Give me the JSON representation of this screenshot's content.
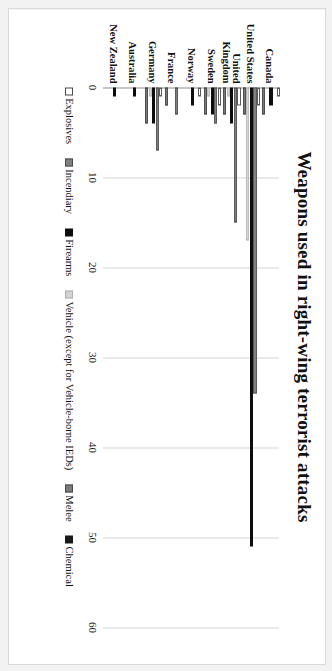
{
  "chart_data": {
    "type": "bar",
    "orientation": "horizontal",
    "title": "Weapons used in right-wing terrorist attacks",
    "xlabel": "",
    "ylabel": "",
    "xlim": [
      0,
      60
    ],
    "ticks": [
      0,
      10,
      20,
      30,
      40,
      50,
      60
    ],
    "grid": true,
    "legend_position": "bottom",
    "categories": [
      "Canada",
      "United States",
      "United Kingdom",
      "Sweden",
      "Norway",
      "France",
      "Germany",
      "Australia",
      "New Zealand"
    ],
    "series": [
      {
        "name": "Explosives",
        "color": "#ffffff",
        "values": [
          1,
          2,
          2,
          2,
          1,
          0,
          1,
          0,
          0
        ]
      },
      {
        "name": "Incendiary",
        "color": "#808080",
        "values": [
          0,
          34,
          15,
          4,
          0,
          3,
          7,
          0,
          0
        ]
      },
      {
        "name": "Firearms",
        "color": "#0d0d0d",
        "values": [
          2,
          51,
          4,
          3,
          2,
          0,
          4,
          1,
          1
        ]
      },
      {
        "name": "Vehicle (except for Vehicle-borne IEDs)",
        "color": "#d4d4d4",
        "values": [
          0,
          17,
          1,
          1,
          0,
          0,
          1,
          0,
          0
        ]
      },
      {
        "name": "Melee",
        "color": "#7a7a7a",
        "values": [
          3,
          3,
          3,
          3,
          0,
          2,
          4,
          0,
          0
        ]
      },
      {
        "name": "Chemical",
        "color": "#1a1a1a",
        "values": [
          0,
          0,
          0,
          0,
          0,
          0,
          0,
          0,
          0
        ]
      }
    ]
  },
  "legend": {
    "items": [
      {
        "label": "Explosives",
        "key": "explosives"
      },
      {
        "label": "Incendiary",
        "key": "incendiary"
      },
      {
        "label": "Firearms",
        "key": "firearms"
      },
      {
        "label": "Vehicle (except for Vehicle-borne IEDs)",
        "key": "vehicle"
      },
      {
        "label": "Melee",
        "key": "melee"
      },
      {
        "label": "Chemical",
        "key": "chemical"
      }
    ]
  }
}
